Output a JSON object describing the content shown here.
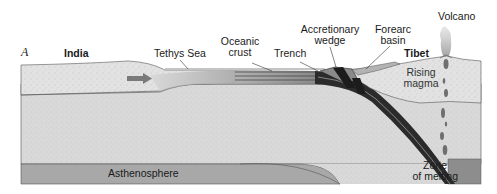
{
  "figure": {
    "panel_letter": "A"
  },
  "labels": {
    "india": "India",
    "tethys_sea": "Tethys Sea",
    "oceanic_crust_line1": "Oceanic",
    "oceanic_crust_line2": "crust",
    "trench": "Trench",
    "accretionary_line1": "Accretionary",
    "accretionary_line2": "wedge",
    "forearc_line1": "Forearc",
    "forearc_line2": "basin",
    "volcano": "Volcano",
    "tibet": "Tibet",
    "rising_line1": "Rising",
    "rising_line2": "magma",
    "asthenosphere": "Asthenosphere",
    "zone_line1": "Zone",
    "zone_line2": "of melting"
  },
  "icons": {
    "plate_motion_arrow": "arrow-right-icon",
    "volcano_plume": "smoke-plume-icon",
    "magma_blobs": "magma-droplet-icon"
  },
  "colors": {
    "continental_crust": "#e4e4e4",
    "lithosphere": "#dcdcdc",
    "asthenosphere": "#a9a9a9",
    "oceanic_crust": "#6e6e6e",
    "slab": "#222222",
    "sea": "#bdbdbd",
    "arrow": "#7a7a7a",
    "outline": "#555555"
  }
}
